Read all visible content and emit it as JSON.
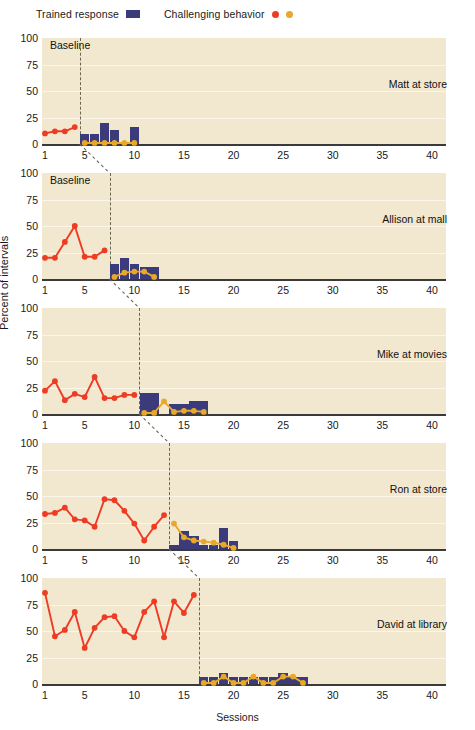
{
  "legend": {
    "trained_label": "Trained response",
    "challenging_label": "Challenging behavior",
    "bar_color": "#3b3a7a",
    "dot_red": "#ee3b24",
    "dot_yellow": "#e8a829"
  },
  "axes": {
    "ylabel": "Percent of intervals",
    "xlabel": "Sessions",
    "yticks": [
      "100",
      "75",
      "50",
      "25",
      "0"
    ],
    "xticks": [
      "1",
      "5",
      "10",
      "15",
      "20",
      "25",
      "30",
      "35",
      "40"
    ],
    "baseline_label": "Baseline"
  },
  "panels": [
    {
      "name": "Matt at store",
      "baseline_label": "Baseline",
      "phase_change_after": 4
    },
    {
      "name": "Allison at mall",
      "baseline_label": "Baseline",
      "phase_change_after": 7
    },
    {
      "name": "Mike at movies",
      "baseline_label": "",
      "phase_change_after": 10
    },
    {
      "name": "Ron at store",
      "baseline_label": "",
      "phase_change_after": 13
    },
    {
      "name": "David at library",
      "baseline_label": "",
      "phase_change_after": 16
    }
  ],
  "chart_data": {
    "type": "line",
    "title": "",
    "subtitle": "",
    "xlabel": "Sessions",
    "ylabel": "Percent of intervals",
    "xlim": [
      0.2,
      41
    ],
    "ylim": [
      0,
      100
    ],
    "xticks": [
      1,
      5,
      10,
      15,
      20,
      25,
      30,
      35,
      40
    ],
    "yticks": [
      0,
      25,
      50,
      75,
      100
    ],
    "grid": "horizontal",
    "legend": [
      {
        "name": "Trained response",
        "marker": "bar",
        "color": "#3b3a7a"
      },
      {
        "name": "Challenging behavior",
        "marker": "circle",
        "color": "#ee3b24"
      },
      {
        "name": "Challenging behavior (intervention)",
        "marker": "circle",
        "color": "#e8a829"
      }
    ],
    "design": "multiple-baseline across participants",
    "panels": [
      {
        "label": "Matt at store",
        "phase_change_after_session": 4,
        "baseline": {
          "series_name": "Challenging behavior",
          "color": "#ee3b24",
          "x": [
            1,
            2,
            3,
            4
          ],
          "y": [
            10,
            12,
            12,
            16
          ]
        },
        "intervention_challenging": {
          "series_name": "Challenging behavior",
          "color": "#e8a829",
          "x": [
            5,
            6,
            7,
            8,
            9,
            10
          ],
          "y": [
            1,
            1,
            1,
            1,
            1,
            1
          ]
        },
        "intervention_trained": {
          "series_name": "Trained response",
          "color": "#3b3a7a",
          "x": [
            5,
            6,
            7,
            8,
            9,
            10
          ],
          "y": [
            9,
            9,
            20,
            13,
            0,
            16
          ]
        }
      },
      {
        "label": "Allison at mall",
        "phase_change_after_session": 7,
        "baseline": {
          "series_name": "Challenging behavior",
          "color": "#ee3b24",
          "x": [
            1,
            2,
            3,
            4,
            5,
            6,
            7
          ],
          "y": [
            20,
            20,
            35,
            50,
            21,
            21,
            27
          ]
        },
        "intervention_challenging": {
          "series_name": "Challenging behavior",
          "color": "#e8a829",
          "x": [
            8,
            9,
            10,
            11,
            12
          ],
          "y": [
            2,
            6,
            7,
            7,
            2
          ]
        },
        "intervention_trained": {
          "series_name": "Trained response",
          "color": "#3b3a7a",
          "x": [
            8,
            9,
            10,
            11,
            12
          ],
          "y": [
            14,
            20,
            14,
            11,
            11
          ]
        }
      },
      {
        "label": "Mike at movies",
        "phase_change_after_session": 10,
        "baseline": {
          "series_name": "Challenging behavior",
          "color": "#ee3b24",
          "x": [
            1,
            2,
            3,
            4,
            5,
            6,
            7,
            8,
            9,
            10
          ],
          "y": [
            22,
            31,
            13,
            19,
            16,
            35,
            15,
            15,
            18,
            18
          ]
        },
        "intervention_challenging": {
          "series_name": "Challenging behavior",
          "color": "#e8a829",
          "x": [
            11,
            12,
            13,
            14,
            15,
            16,
            17
          ],
          "y": [
            1,
            1,
            12,
            2,
            3,
            3,
            2
          ]
        },
        "intervention_trained": {
          "series_name": "Trained response",
          "color": "#3b3a7a",
          "x": [
            11,
            12,
            13,
            14,
            15,
            16,
            17
          ],
          "y": [
            20,
            20,
            0,
            9,
            9,
            12,
            12
          ]
        }
      },
      {
        "label": "Ron at store",
        "phase_change_after_session": 13,
        "baseline": {
          "series_name": "Challenging behavior",
          "color": "#ee3b24",
          "x": [
            1,
            2,
            3,
            4,
            5,
            6,
            7,
            8,
            9,
            10,
            11,
            12,
            13
          ],
          "y": [
            33,
            34,
            39,
            28,
            27,
            21,
            47,
            46,
            36,
            24,
            8,
            21,
            32,
            39
          ]
        },
        "intervention_challenging": {
          "series_name": "Challenging behavior",
          "color": "#e8a829",
          "x": [
            14,
            15,
            16,
            17,
            18,
            19,
            20
          ],
          "y": [
            24,
            11,
            8,
            7,
            6,
            4,
            1
          ]
        },
        "intervention_trained": {
          "series_name": "Trained response",
          "color": "#3b3a7a",
          "x": [
            14,
            15,
            16,
            17,
            18,
            19,
            20
          ],
          "y": [
            4,
            17,
            12,
            4,
            4,
            20,
            8
          ]
        }
      },
      {
        "label": "David at library",
        "phase_change_after_session": 16,
        "baseline": {
          "series_name": "Challenging behavior",
          "color": "#ee3b24",
          "x": [
            1,
            2,
            3,
            4,
            5,
            6,
            7,
            8,
            9,
            10,
            11,
            12,
            13,
            14,
            15,
            16
          ],
          "y": [
            86,
            45,
            51,
            68,
            34,
            53,
            63,
            64,
            50,
            44,
            68,
            78,
            44,
            78,
            67,
            84
          ]
        },
        "intervention_challenging": {
          "series_name": "Challenging behavior",
          "color": "#e8a829",
          "x": [
            17,
            18,
            19,
            20,
            21,
            22,
            23,
            24,
            25,
            26,
            27
          ],
          "y": [
            1,
            1,
            7,
            1,
            1,
            7,
            1,
            1,
            7,
            7,
            1
          ]
        },
        "intervention_trained": {
          "series_name": "Trained response",
          "color": "#3b3a7a",
          "x": [
            17,
            18,
            19,
            20,
            21,
            22,
            23,
            24,
            25,
            26,
            27
          ],
          "y": [
            7,
            7,
            10,
            7,
            7,
            7,
            7,
            7,
            10,
            7,
            7
          ]
        }
      }
    ]
  }
}
